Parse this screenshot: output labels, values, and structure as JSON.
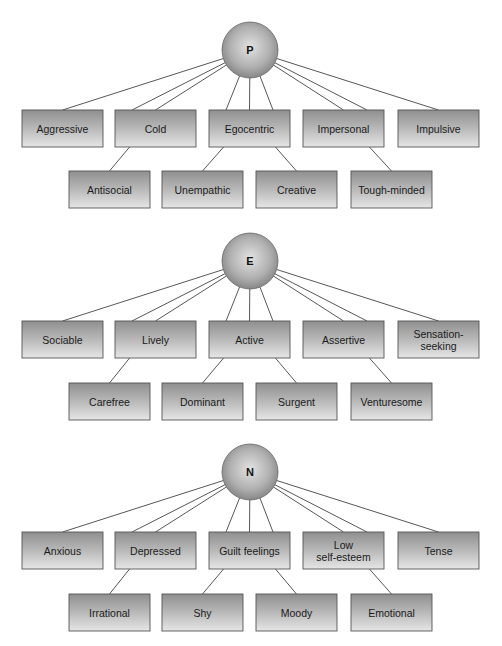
{
  "diagram": {
    "groups": [
      {
        "hub": "P",
        "top": [
          "Aggressive",
          "Cold",
          "Egocentric",
          "Impersonal",
          "Impulsive"
        ],
        "bottom": [
          {
            "label": "Antisocial",
            "parent": "Cold"
          },
          {
            "label": "Unempathic",
            "parent": "Egocentric"
          },
          {
            "label": "Creative",
            "parent": "Egocentric"
          },
          {
            "label": "Tough-minded",
            "parent": "Impersonal"
          }
        ]
      },
      {
        "hub": "E",
        "top": [
          "Sociable",
          "Lively",
          "Active",
          "Assertive",
          "Sensation-seeking"
        ],
        "bottom": [
          {
            "label": "Carefree",
            "parent": "Lively"
          },
          {
            "label": "Dominant",
            "parent": "Active"
          },
          {
            "label": "Surgent",
            "parent": "Active"
          },
          {
            "label": "Venturesome",
            "parent": "Assertive"
          }
        ]
      },
      {
        "hub": "N",
        "top": [
          "Anxious",
          "Depressed",
          "Guilt feelings",
          "Low self-esteem",
          "Tense"
        ],
        "bottom": [
          {
            "label": "Irrational",
            "parent": "Depressed"
          },
          {
            "label": "Shy",
            "parent": "Guilt feelings"
          },
          {
            "label": "Moody",
            "parent": "Guilt feelings"
          },
          {
            "label": "Emotional",
            "parent": "Low self-esteem"
          }
        ]
      }
    ],
    "line_breaks": {
      "Sensation-seeking": [
        "Sensation-",
        "seeking"
      ],
      "Low self-esteem": [
        "Low",
        "self-esteem"
      ]
    }
  }
}
